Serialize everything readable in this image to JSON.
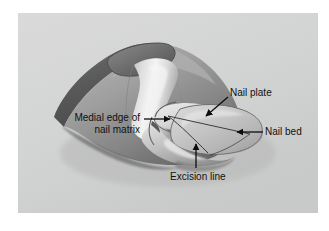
{
  "figure": {
    "kind": "anatomical-illustration",
    "panel": {
      "background_color": "#d3d4d4",
      "border_color": "#ffffff",
      "left": 18,
      "top": 13,
      "width": 300,
      "height": 200
    }
  },
  "labels": {
    "nail_plate": "Nail plate",
    "nail_bed": "Nail bed",
    "medial_edge_line1": "Medial edge of",
    "medial_edge_line2": "nail matrix",
    "excision_line": "Excision line"
  },
  "annotations": [
    {
      "id": "nail-plate",
      "text": "Nail plate",
      "arrow_direction": "down-left",
      "text_x": 230,
      "text_y": 87,
      "arrow_from": [
        228,
        97
      ],
      "arrow_to": [
        205,
        116
      ]
    },
    {
      "id": "nail-bed",
      "text": "Nail bed",
      "arrow_direction": "left",
      "text_x": 265,
      "text_y": 126,
      "arrow_from": [
        262,
        132
      ],
      "arrow_to": [
        236,
        132
      ]
    },
    {
      "id": "medial-edge-of-nail-matrix",
      "text": "Medial edge of nail matrix",
      "arrow_direction": "right",
      "text_x": 60,
      "text_y": 112,
      "arrow_from": [
        146,
        119
      ],
      "arrow_to": [
        172,
        119
      ]
    },
    {
      "id": "excision-line",
      "text": "Excision line",
      "arrow_direction": "up",
      "text_x": 170,
      "text_y": 171,
      "arrow_from": [
        196,
        168
      ],
      "arrow_to": [
        196,
        143
      ]
    }
  ],
  "colors": {
    "panel_bg": "#d3d4d4",
    "skin_dark": "#7c7c7c",
    "skin_mid": "#9a9a9a",
    "skin_light": "#c9c9c9",
    "bone_highlight": "#f2f2f2",
    "nail_plate": "#c4c4c4",
    "nail_plate_light": "#dedede",
    "shadow": "#5e5e5e",
    "cut_face": "#6a6a6a",
    "outline": "#3a3a3a",
    "label_text": "#101010",
    "arrow": "#0d0d0d"
  }
}
